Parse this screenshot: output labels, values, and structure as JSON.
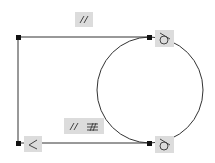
{
  "sketch": {
    "entities": {
      "top_line": {
        "x1": 18,
        "y1": 37,
        "x2": 149,
        "y2": 37
      },
      "left_line": {
        "x1": 18,
        "y1": 37,
        "x2": 18,
        "y2": 143
      },
      "bottom_line": {
        "x1": 18,
        "y1": 143,
        "x2": 149,
        "y2": 143
      },
      "circle": {
        "cx": 150,
        "cy": 90,
        "r": 53
      }
    },
    "constraints": {
      "top_parallel": {
        "symbol": "//",
        "x": 75,
        "y": 12,
        "w": 18,
        "h": 15
      },
      "middle_parallel_equal": {
        "symbol": "// ═",
        "x": 64,
        "y": 118,
        "w": 40,
        "h": 16
      },
      "perpendicular": {
        "symbol": "⊥",
        "x": 24,
        "y": 136,
        "w": 18,
        "h": 16
      },
      "tangent_top": {
        "symbol": "tangent",
        "x": 155,
        "y": 30,
        "w": 19,
        "h": 17
      },
      "tangent_bottom": {
        "symbol": "tangent",
        "x": 155,
        "y": 136,
        "w": 19,
        "h": 17
      }
    },
    "colors": {
      "line": "#333333",
      "badge": "#dcdcdc",
      "point": "#111111"
    }
  }
}
